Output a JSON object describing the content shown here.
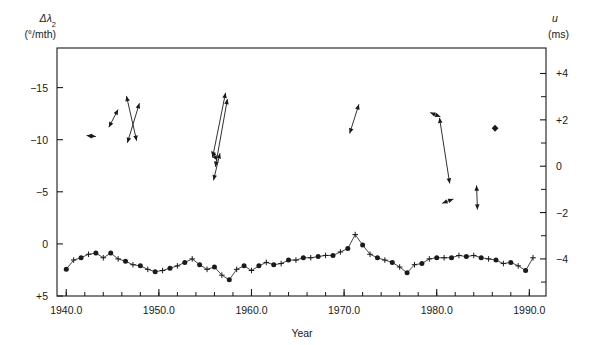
{
  "figure": {
    "title": "",
    "background": "#ffffff",
    "ink_color": "#1a1a1a",
    "width": 604,
    "height": 345
  },
  "axes": {
    "left": {
      "symbol": "Δλ",
      "subscript": "2",
      "units": "(°/mth)",
      "ticks": [
        "−15",
        "−10",
        "−5",
        "0",
        "+5"
      ],
      "tick_values": [
        -15,
        -10,
        -5,
        0,
        5
      ],
      "range": [
        -18.8,
        5.0
      ],
      "inverted": true
    },
    "right": {
      "symbol": "u",
      "units": "(ms)",
      "ticks": [
        "+4",
        "+2",
        "0",
        "−2",
        "−4"
      ],
      "tick_values": [
        4,
        2,
        0,
        -2,
        -4
      ],
      "range": [
        -5.6,
        5.1
      ],
      "minor_ticks": [
        3,
        1,
        -1,
        -3,
        -5
      ]
    },
    "bottom": {
      "title": "Year",
      "ticks": [
        "1940.0",
        "1950.0",
        "1960.0",
        "1970.0",
        "1980.0",
        "1990.0"
      ],
      "tick_values": [
        1940,
        1950,
        1960,
        1970,
        1980,
        1990
      ],
      "range": [
        1939.0,
        1991.8
      ],
      "minor_tick_step": 2
    }
  },
  "chart_data": {
    "type": "scatter",
    "title": "",
    "xlabel": "Year",
    "ylabel": "Δλ2 (°/mth)",
    "ylabel_right": "u (ms)",
    "xlim": [
      1939.0,
      1991.8
    ],
    "ylim_left": [
      5.0,
      -18.8
    ],
    "ylim_right": [
      -5.6,
      5.1
    ],
    "grid": false,
    "legend": false,
    "series": [
      {
        "name": "geomagnetic-jerk-arrows",
        "type": "arrow-segments",
        "marker": "arrowhead",
        "comment": "Double-headed arrow segments plotted on the left axis in the upper half of the frame",
        "segments": [
          {
            "x1": 1942.2,
            "y1": -10.4,
            "x2": 1943.2,
            "y2": -10.3
          },
          {
            "x1": 1944.6,
            "y1": -11.2,
            "x2": 1945.6,
            "y2": -12.9
          },
          {
            "x1": 1946.5,
            "y1": -14.2,
            "x2": 1947.6,
            "y2": -9.9
          },
          {
            "x1": 1946.6,
            "y1": -9.7,
            "x2": 1947.9,
            "y2": -13.5
          },
          {
            "x1": 1955.8,
            "y1": -8.3,
            "x2": 1957.2,
            "y2": -14.5
          },
          {
            "x1": 1956.1,
            "y1": -7.4,
            "x2": 1957.4,
            "y2": -13.9
          },
          {
            "x1": 1955.7,
            "y1": -8.9,
            "x2": 1956.3,
            "y2": -8.0
          },
          {
            "x1": 1955.9,
            "y1": -6.1,
            "x2": 1956.6,
            "y2": -8.7
          },
          {
            "x1": 1970.6,
            "y1": -10.6,
            "x2": 1971.6,
            "y2": -13.4
          },
          {
            "x1": 1979.3,
            "y1": -12.6,
            "x2": 1980.4,
            "y2": -12.2
          },
          {
            "x1": 1980.3,
            "y1": -12.1,
            "x2": 1981.4,
            "y2": -5.8
          },
          {
            "x1": 1980.6,
            "y1": -3.9,
            "x2": 1981.8,
            "y2": -4.3
          },
          {
            "x1": 1984.3,
            "y1": -5.6,
            "x2": 1984.4,
            "y2": -3.3
          }
        ],
        "points": [
          {
            "x": 1986.3,
            "y": -11.1,
            "marker": "diamond"
          }
        ]
      },
      {
        "name": "length-of-day-u",
        "type": "line-scatter",
        "comment": "Lower time series, annual values read on the right-hand u (ms) axis; markers alternate filled circle and plus",
        "x": [
          1940.0,
          1940.8,
          1941.6,
          1942.4,
          1943.2,
          1944.0,
          1944.8,
          1945.6,
          1946.4,
          1947.2,
          1948.0,
          1948.8,
          1949.6,
          1950.4,
          1951.2,
          1952.0,
          1952.8,
          1953.6,
          1954.4,
          1955.2,
          1956.0,
          1956.8,
          1957.6,
          1958.4,
          1959.2,
          1960.0,
          1960.8,
          1961.6,
          1962.4,
          1963.2,
          1964.0,
          1964.8,
          1965.6,
          1966.4,
          1967.2,
          1968.0,
          1968.8,
          1969.6,
          1970.4,
          1971.2,
          1972.0,
          1972.8,
          1973.6,
          1974.4,
          1975.2,
          1976.0,
          1976.8,
          1977.6,
          1978.4,
          1979.2,
          1980.0,
          1980.8,
          1981.6,
          1982.4,
          1983.2,
          1984.0,
          1984.8,
          1985.6,
          1986.4,
          1987.2,
          1988.0,
          1988.8,
          1989.6,
          1990.4
        ],
        "y": [
          -4.45,
          -4.05,
          -3.95,
          -3.8,
          -3.75,
          -3.95,
          -3.75,
          -4.0,
          -4.1,
          -4.25,
          -4.3,
          -4.45,
          -4.55,
          -4.5,
          -4.4,
          -4.3,
          -4.15,
          -4.0,
          -4.25,
          -4.45,
          -4.35,
          -4.7,
          -4.9,
          -4.45,
          -4.3,
          -4.5,
          -4.3,
          -4.15,
          -4.25,
          -4.2,
          -4.05,
          -4.05,
          -3.95,
          -3.95,
          -3.9,
          -3.85,
          -3.85,
          -3.7,
          -3.55,
          -2.95,
          -3.4,
          -3.8,
          -3.95,
          -4.05,
          -4.15,
          -4.35,
          -4.6,
          -4.25,
          -4.2,
          -4.0,
          -3.95,
          -3.95,
          -3.95,
          -3.85,
          -3.9,
          -3.85,
          -3.95,
          -4.0,
          -4.05,
          -4.2,
          -4.15,
          -4.3,
          -4.5,
          -3.95
        ]
      }
    ]
  }
}
